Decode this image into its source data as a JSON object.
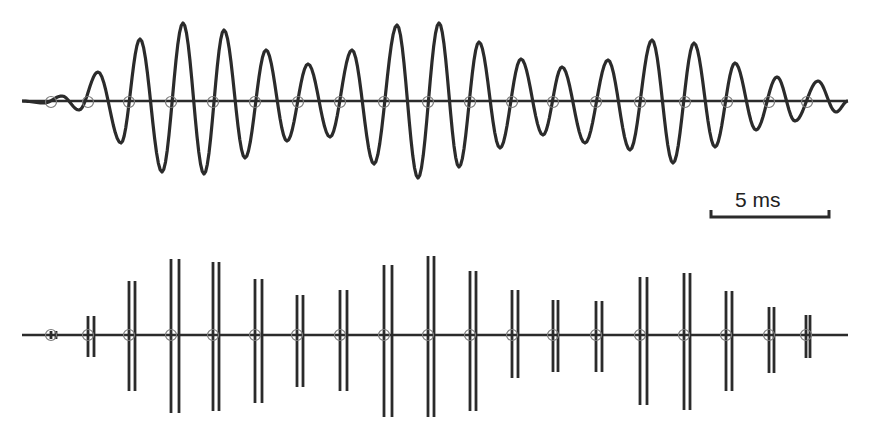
{
  "chart_data": [
    {
      "type": "line",
      "title": "",
      "description": "Oscillating waveform with amplitude-modulated envelope; circles mark upward zero-crossings on baseline",
      "xlabel": "",
      "ylabel": "",
      "grid": false,
      "baseline_y_px": 101,
      "start_x_px": 22,
      "end_x_px": 848,
      "extrema_px": [
        {
          "x": 22,
          "y": 101
        },
        {
          "x": 44,
          "y": 103
        },
        {
          "x": 62,
          "y": 96
        },
        {
          "x": 79,
          "y": 110
        },
        {
          "x": 98,
          "y": 72
        },
        {
          "x": 121,
          "y": 143
        },
        {
          "x": 140,
          "y": 39
        },
        {
          "x": 162,
          "y": 172
        },
        {
          "x": 183,
          "y": 23
        },
        {
          "x": 204,
          "y": 174
        },
        {
          "x": 224,
          "y": 30
        },
        {
          "x": 245,
          "y": 158
        },
        {
          "x": 266,
          "y": 50
        },
        {
          "x": 287,
          "y": 141
        },
        {
          "x": 308,
          "y": 64
        },
        {
          "x": 330,
          "y": 137
        },
        {
          "x": 352,
          "y": 50
        },
        {
          "x": 374,
          "y": 164
        },
        {
          "x": 397,
          "y": 25
        },
        {
          "x": 418,
          "y": 178
        },
        {
          "x": 439,
          "y": 23
        },
        {
          "x": 459,
          "y": 167
        },
        {
          "x": 479,
          "y": 42
        },
        {
          "x": 500,
          "y": 148
        },
        {
          "x": 521,
          "y": 59
        },
        {
          "x": 543,
          "y": 135
        },
        {
          "x": 562,
          "y": 67
        },
        {
          "x": 585,
          "y": 143
        },
        {
          "x": 608,
          "y": 60
        },
        {
          "x": 630,
          "y": 150
        },
        {
          "x": 652,
          "y": 40
        },
        {
          "x": 673,
          "y": 163
        },
        {
          "x": 694,
          "y": 43
        },
        {
          "x": 715,
          "y": 147
        },
        {
          "x": 735,
          "y": 63
        },
        {
          "x": 756,
          "y": 130
        },
        {
          "x": 777,
          "y": 77
        },
        {
          "x": 795,
          "y": 121
        },
        {
          "x": 818,
          "y": 81
        },
        {
          "x": 836,
          "y": 112
        },
        {
          "x": 848,
          "y": 101
        }
      ],
      "zero_crossing_markers_x_px": [
        51,
        88,
        129,
        171,
        213,
        255,
        298,
        340,
        384,
        428,
        470,
        512,
        553,
        596,
        640,
        685,
        727,
        769,
        807
      ]
    },
    {
      "type": "bar",
      "title": "",
      "description": "Paired vertical spike bars at each zero-crossing marker, symmetric about baseline; length tracks waveform envelope",
      "xlabel": "",
      "ylabel": "",
      "grid": false,
      "baseline_y_px": 335,
      "start_x_px": 22,
      "end_x_px": 848,
      "bars": [
        {
          "x": 51,
          "dx": 5,
          "top": 331,
          "bottom": 339
        },
        {
          "x": 88,
          "dx": 6,
          "top": 316,
          "bottom": 357
        },
        {
          "x": 129,
          "dx": 6,
          "top": 281,
          "bottom": 391
        },
        {
          "x": 171,
          "dx": 8,
          "top": 259,
          "bottom": 413
        },
        {
          "x": 213,
          "dx": 6,
          "top": 262,
          "bottom": 411
        },
        {
          "x": 255,
          "dx": 7,
          "top": 279,
          "bottom": 403
        },
        {
          "x": 297,
          "dx": 6,
          "top": 295,
          "bottom": 387
        },
        {
          "x": 340,
          "dx": 7,
          "top": 290,
          "bottom": 391
        },
        {
          "x": 384,
          "dx": 8,
          "top": 265,
          "bottom": 417
        },
        {
          "x": 428,
          "dx": 6,
          "top": 256,
          "bottom": 417
        },
        {
          "x": 470,
          "dx": 6,
          "top": 271,
          "bottom": 411
        },
        {
          "x": 512,
          "dx": 6,
          "top": 290,
          "bottom": 378
        },
        {
          "x": 553,
          "dx": 5,
          "top": 300,
          "bottom": 372
        },
        {
          "x": 596,
          "dx": 6,
          "top": 301,
          "bottom": 372
        },
        {
          "x": 640,
          "dx": 7,
          "top": 277,
          "bottom": 405
        },
        {
          "x": 684,
          "dx": 6,
          "top": 273,
          "bottom": 410
        },
        {
          "x": 726,
          "dx": 6,
          "top": 291,
          "bottom": 391
        },
        {
          "x": 769,
          "dx": 5,
          "top": 307,
          "bottom": 373
        },
        {
          "x": 806,
          "dx": 4,
          "top": 315,
          "bottom": 358
        }
      ]
    }
  ],
  "scale_bar": {
    "label": "5 ms",
    "x1_px": 711,
    "x2_px": 829,
    "y_px": 217
  },
  "colors": {
    "ink": "#2b2b2b",
    "marker": "#7a7a7a",
    "background": "#ffffff"
  }
}
